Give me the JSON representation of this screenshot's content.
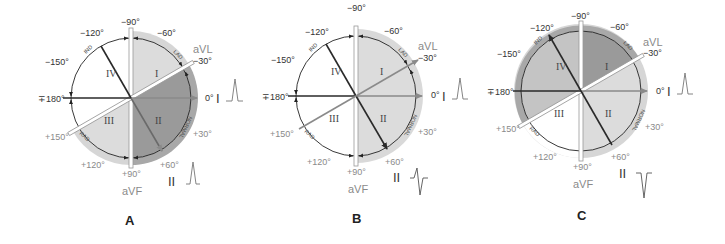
{
  "figure": {
    "colors": {
      "quadrant_dark": "#9a9a9a",
      "quadrant_mid": "#c4c4c4",
      "quadrant_light": "#dcdcdc",
      "outer_ring": "#d6d6d6",
      "axis_gray": "#8a8a8a",
      "axis_dark": "#2a2a2a"
    },
    "angle_labels": {
      "m90": "−90°",
      "m60": "−60°",
      "m30": "−30°",
      "zero": "0°",
      "p30": "+30°",
      "p60": "+60°",
      "p90": "+90°",
      "p120": "+120°",
      "p150": "+150°",
      "pm180": "∓180°",
      "m150": "−150°",
      "m120": "−120°"
    },
    "lead_labels": {
      "avl": "aVL",
      "avf": "aVF",
      "lead1": "I",
      "lead2": "II"
    },
    "quadrants": [
      "I",
      "II",
      "III",
      "IV"
    ],
    "arc_labels": {
      "lad": "LAD",
      "normal": "NORMAL",
      "rad": "RAD",
      "ind": "IND"
    },
    "panels": [
      {
        "label": "A",
        "lead1_complex": "upright",
        "lead2_complex": "upright",
        "shaded_region": "Normal axis (-30° to +90°)"
      },
      {
        "label": "B",
        "lead1_complex": "upright",
        "lead2_complex": "biphasic",
        "shaded_region": "Left axis (-90° to +90° half), aVL arrow"
      },
      {
        "label": "C",
        "lead1_complex": "upright",
        "lead2_complex": "negative",
        "shaded_region": "Left axis deviation (-30° to -90°), -120° arrow"
      }
    ]
  }
}
